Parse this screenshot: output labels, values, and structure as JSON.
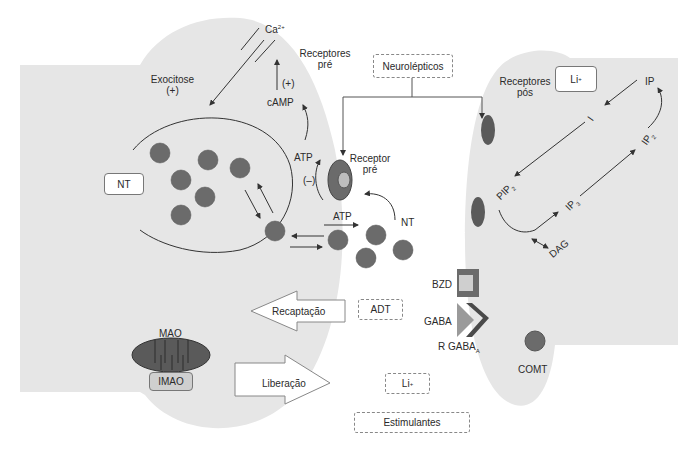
{
  "diagram": {
    "type": "synapse-neurotransmission",
    "presynaptic": {
      "labels": {
        "ca": "Ca",
        "ca_sup": "2+",
        "exocitose": "Exocitose",
        "exocitose_sign": "(+)",
        "receptores_pre_line1": "Receptores",
        "receptores_pre_line2": "pré",
        "camp_sign": "(+)",
        "camp": "cAMP",
        "atp_top": "ATP",
        "inhibit_sign": "(–)",
        "receptor_pre_line1": "Receptor",
        "receptor_pre_line2": "pré",
        "atp_mid": "ATP",
        "nt_cleft": "NT",
        "mao": "MAO"
      },
      "nt_box": "NT",
      "imao_box": "IMAO"
    },
    "arrows": {
      "recaptacao": "Recaptação",
      "liberacao": "Liberação"
    },
    "drugs": {
      "neurolepticos": "Neurolépticos",
      "adt": "ADT",
      "li": "Li",
      "li_sup": "+",
      "estimulantes": "Estimulantes"
    },
    "gaba": {
      "bzd": "BZD",
      "gaba": "GABA",
      "r_gaba": "R GABA",
      "r_gaba_sub": "A"
    },
    "postsynaptic": {
      "receptores_pos_line1": "Receptores",
      "receptores_pos_line2": "pós",
      "li_box": "Li",
      "li_box_sup": "+",
      "ip": "IP",
      "i": "I",
      "ip2": "IP",
      "ip2_sub": "2",
      "pip2": "PIP",
      "pip2_sub": "2",
      "ip3": "IP",
      "ip3_sub": "3",
      "dag": "DAG",
      "comt": "COMT"
    },
    "colors": {
      "cell_fill": "#e6e6e6",
      "vesicle": "#6b6b6b",
      "receptor_dark": "#5a5a5a",
      "receptor_light": "#bdbdbd",
      "line": "#333333"
    }
  }
}
